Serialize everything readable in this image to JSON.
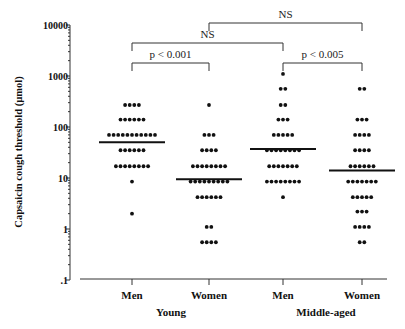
{
  "chart_data": {
    "type": "scatter",
    "subtype": "dot-plot with medians",
    "title": "",
    "xlabel": "",
    "ylabel": "Capsaicin cough threshold (µmol)",
    "yscale": "log",
    "ylim": [
      0.1,
      10000
    ],
    "yticks": [
      {
        "value": 10000,
        "label": "10000"
      },
      {
        "value": 1000,
        "label": "1000"
      },
      {
        "value": 100,
        "label": "100"
      },
      {
        "value": 10,
        "label": "10"
      },
      {
        "value": 1,
        "label": "1"
      },
      {
        "value": 0.1,
        "label": ".1"
      }
    ],
    "categories": [
      "Men",
      "Women",
      "Men",
      "Women"
    ],
    "groups": [
      {
        "label": "Young",
        "categories": [
          0,
          1
        ]
      },
      {
        "label": "Middle-aged",
        "categories": [
          2,
          3
        ]
      }
    ],
    "grid": false,
    "legend": null,
    "series": [
      {
        "name": "Young Men",
        "median": 50,
        "rows": [
          {
            "value": 270,
            "count": 4
          },
          {
            "value": 140,
            "count": 6
          },
          {
            "value": 70,
            "count": 11
          },
          {
            "value": 35,
            "count": 6
          },
          {
            "value": 17,
            "count": 8
          },
          {
            "value": 8.5,
            "count": 1
          },
          {
            "value": 2,
            "count": 1
          }
        ]
      },
      {
        "name": "Young Women",
        "median": 9.5,
        "rows": [
          {
            "value": 270,
            "count": 1
          },
          {
            "value": 70,
            "count": 3
          },
          {
            "value": 35,
            "count": 4
          },
          {
            "value": 17,
            "count": 8
          },
          {
            "value": 8.5,
            "count": 9
          },
          {
            "value": 4.2,
            "count": 6
          },
          {
            "value": 1.1,
            "count": 2
          },
          {
            "value": 0.55,
            "count": 4
          }
        ]
      },
      {
        "name": "Middle-aged Men",
        "median": 37,
        "rows": [
          {
            "value": 1100,
            "count": 1
          },
          {
            "value": 560,
            "count": 2
          },
          {
            "value": 270,
            "count": 2
          },
          {
            "value": 140,
            "count": 3
          },
          {
            "value": 70,
            "count": 5
          },
          {
            "value": 35,
            "count": 8
          },
          {
            "value": 17,
            "count": 7
          },
          {
            "value": 8.5,
            "count": 8
          },
          {
            "value": 4.2,
            "count": 1
          }
        ]
      },
      {
        "name": "Middle-aged Women",
        "median": 14,
        "rows": [
          {
            "value": 560,
            "count": 2
          },
          {
            "value": 140,
            "count": 3
          },
          {
            "value": 70,
            "count": 4
          },
          {
            "value": 35,
            "count": 4
          },
          {
            "value": 17,
            "count": 6
          },
          {
            "value": 8.5,
            "count": 7
          },
          {
            "value": 4.2,
            "count": 5
          },
          {
            "value": 2.2,
            "count": 3
          },
          {
            "value": 1.1,
            "count": 4
          },
          {
            "value": 0.55,
            "count": 2
          }
        ]
      }
    ],
    "annotations": [
      {
        "type": "bracket",
        "from": 1,
        "to": 3,
        "label": "NS",
        "level": 0
      },
      {
        "type": "bracket",
        "from": 0,
        "to": 2,
        "label": "NS",
        "level": 1
      },
      {
        "type": "bracket",
        "from": 0,
        "to": 1,
        "label": "p < 0.001",
        "level": 2
      },
      {
        "type": "bracket",
        "from": 2,
        "to": 3,
        "label": "p < 0.005",
        "level": 2
      }
    ]
  }
}
